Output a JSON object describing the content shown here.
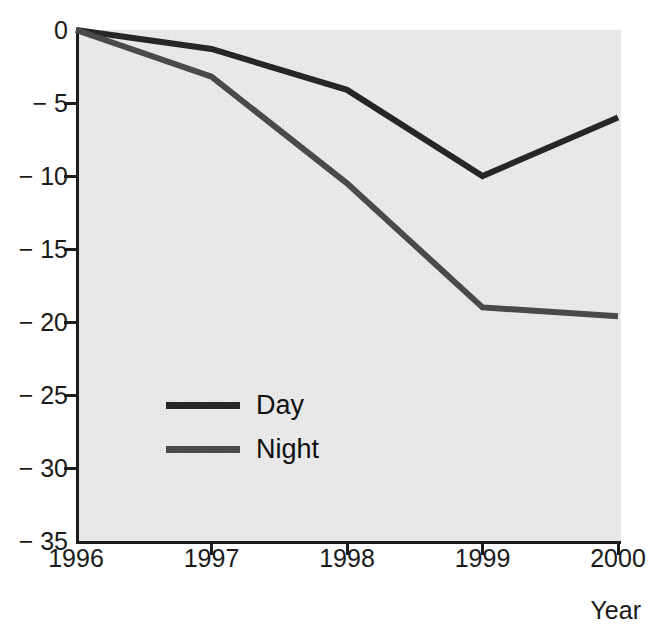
{
  "figure": {
    "top_text_fragment": "g",
    "background_color": "#ececec",
    "axis_color": "#1c1c1c"
  },
  "axes": {
    "x_title": "Year",
    "y_title": "",
    "x_tick_labels": [
      "1996",
      "1997",
      "1998",
      "1999",
      "2000"
    ],
    "y_tick_labels": [
      "0",
      "− 5",
      "− 10",
      "− 15",
      "− 20",
      "− 25",
      "− 30",
      "− 35"
    ]
  },
  "legend": {
    "items": [
      {
        "label": "Day",
        "color": "#262626"
      },
      {
        "label": "Night",
        "color": "#4a4a4a"
      }
    ]
  },
  "chart_data": {
    "type": "line",
    "title": "",
    "subtitle": "",
    "xlabel": "Year",
    "ylabel": "",
    "x": [
      1996,
      1997,
      1998,
      1999,
      2000
    ],
    "categories": [
      "1996",
      "1997",
      "1998",
      "1999",
      "2000"
    ],
    "series": [
      {
        "name": "Day",
        "color": "#262626",
        "values": [
          0,
          -1.3,
          -4.1,
          -10.0,
          -6.0
        ]
      },
      {
        "name": "Night",
        "color": "#4a4a4a",
        "values": [
          0,
          -3.2,
          -10.5,
          -19.0,
          -19.6
        ]
      }
    ],
    "xlim": [
      1996,
      2000
    ],
    "ylim": [
      -35,
      0
    ],
    "y_ticks": [
      0,
      -5,
      -10,
      -15,
      -20,
      -25,
      -30,
      -35
    ],
    "x_ticks": [
      1996,
      1997,
      1998,
      1999,
      2000
    ],
    "grid": false,
    "legend_position": "inside-center-left",
    "line_width": 6
  }
}
